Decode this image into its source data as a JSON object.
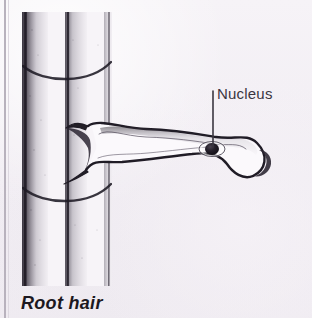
{
  "figure": {
    "kind": "biology-diagram",
    "background_color": "#f3f0f5",
    "ink_color": "#231f27",
    "margin_rule_color": "#b8b2bd"
  },
  "labels": {
    "nucleus": "Nucleus",
    "caption": "Root hair"
  },
  "annotations": {
    "leader_line": {
      "from_x": 213,
      "from_y": 91,
      "to_x": 213,
      "to_y": 146,
      "color": "#3a3640"
    },
    "nucleus_marker": {
      "cx": 212,
      "cy": 149,
      "rx": 7,
      "ry": 6,
      "fill": "#1a161e"
    }
  },
  "structures": [
    {
      "name": "root-cylinder",
      "description": "shaded root segment with three vertical cell-wall lines and two curved cross walls"
    },
    {
      "name": "root-hair-cell",
      "description": "long tubular outgrowth extending right from the root, tip curled downward"
    },
    {
      "name": "nucleus",
      "description": "dark oval body inside the root hair with a pale halo"
    }
  ]
}
